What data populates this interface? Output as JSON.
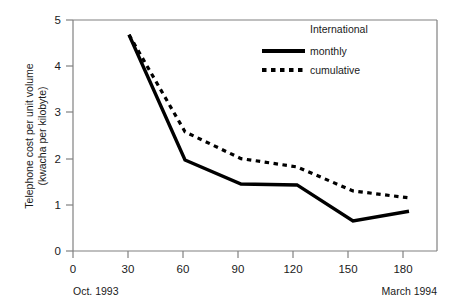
{
  "chart_data": {
    "type": "line",
    "title": "",
    "subtitle": "",
    "xlabel": "",
    "ylabel": "Telephone cost per unit volume (kwacha per kilobyte)",
    "ylabel_line1": "Telephone cost per unit volume",
    "ylabel_line2": "(kwacha per kilobyte)",
    "xlim": [
      0,
      195
    ],
    "ylim": [
      0,
      5
    ],
    "grid": false,
    "x_ticks": [
      0,
      30,
      60,
      90,
      120,
      150,
      180
    ],
    "x_tick_labels": [
      "0",
      "30",
      "60",
      "90",
      "120",
      "150",
      "180"
    ],
    "y_ticks": [
      0,
      1,
      2,
      3,
      4,
      5
    ],
    "y_tick_labels": [
      "0",
      "1",
      "2",
      "3",
      "4",
      "5"
    ],
    "x": [
      30,
      60,
      90,
      120,
      150,
      180
    ],
    "legend_title": "International",
    "legend_position": "upper-right-inside",
    "series": [
      {
        "name": "monthly",
        "style": "solid",
        "color": "#000000",
        "values": [
          4.68,
          1.97,
          1.45,
          1.43,
          0.65,
          0.86
        ]
      },
      {
        "name": "cumulative",
        "style": "dotted",
        "color": "#000000",
        "values": [
          4.68,
          2.58,
          2.0,
          1.82,
          1.3,
          1.15
        ]
      }
    ],
    "annotations": [
      {
        "name": "start-period",
        "text": "Oct. 1993",
        "x": 0
      },
      {
        "name": "end-period",
        "text": "March 1994",
        "x": 180
      }
    ]
  },
  "axes": {
    "y_label_line1": "Telephone cost per unit volume",
    "y_label_line2": "(kwacha per kilobyte)",
    "y_tick_0": "0",
    "y_tick_1": "1",
    "y_tick_2": "2",
    "y_tick_3": "3",
    "y_tick_4": "4",
    "y_tick_5": "5",
    "x_tick_0": "0",
    "x_tick_30": "30",
    "x_tick_60": "60",
    "x_tick_90": "90",
    "x_tick_120": "120",
    "x_tick_150": "150",
    "x_tick_180": "180"
  },
  "period_labels": {
    "start": "Oct. 1993",
    "end": "March 1994"
  },
  "legend": {
    "title": "International",
    "entry_monthly": "monthly",
    "entry_cumulative": "cumulative"
  },
  "colors": {
    "line": "#000000",
    "axis": "#808080",
    "text": "#1a1a1a",
    "background": "#ffffff"
  }
}
